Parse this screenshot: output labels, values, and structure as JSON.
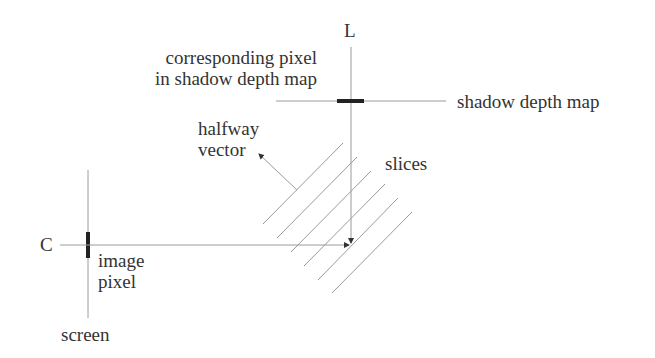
{
  "labels": {
    "light": "L",
    "camera": "C",
    "corresponding_pixel_line1": "corresponding pixel",
    "corresponding_pixel_line2": "in shadow depth map",
    "shadow_depth_map": "shadow depth map",
    "halfway_line1": "halfway",
    "halfway_line2": "vector",
    "slices": "slices",
    "image_line1": "image",
    "image_line2": "pixel",
    "screen": "screen"
  },
  "colors": {
    "thin_line": "#9a9a9a",
    "thick_bar": "#222222",
    "text": "#333333"
  },
  "slices_count": 6
}
